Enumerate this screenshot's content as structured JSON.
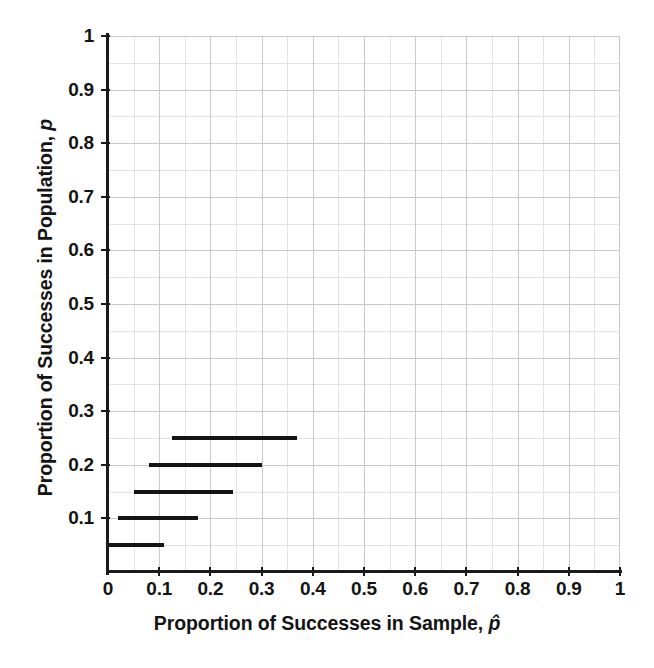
{
  "chart_data": {
    "type": "line",
    "title": "",
    "xlabel": "Proportion of Successes in Sample, p̂",
    "ylabel": "Proportion of Successes in Population, p",
    "xlim": [
      0,
      1
    ],
    "ylim": [
      0,
      1
    ],
    "grid": true,
    "grid_major_step": 0.1,
    "grid_minor_step": 0.05,
    "legend": "none",
    "x_ticks": [
      "0",
      "0.1",
      "0.2",
      "0.3",
      "0.4",
      "0.5",
      "0.6",
      "0.7",
      "0.8",
      "0.9",
      "1"
    ],
    "x_tick_values": [
      0,
      0.1,
      0.2,
      0.3,
      0.4,
      0.5,
      0.6,
      0.7,
      0.8,
      0.9,
      1
    ],
    "y_ticks": [
      "0.1",
      "0.2",
      "0.3",
      "0.4",
      "0.5",
      "0.6",
      "0.7",
      "0.8",
      "0.9",
      "1"
    ],
    "y_tick_values": [
      0.1,
      0.2,
      0.3,
      0.4,
      0.5,
      0.6,
      0.7,
      0.8,
      0.9,
      1
    ],
    "series": [
      {
        "name": "confidence-interval-segments",
        "orientation": "horizontal",
        "color": "#141414",
        "points": [
          {
            "p": 0.05,
            "x_start": 0.0,
            "x_end": 0.11
          },
          {
            "p": 0.1,
            "x_start": 0.02,
            "x_end": 0.175
          },
          {
            "p": 0.15,
            "x_start": 0.05,
            "x_end": 0.245
          },
          {
            "p": 0.2,
            "x_start": 0.08,
            "x_end": 0.3
          },
          {
            "p": 0.25,
            "x_start": 0.125,
            "x_end": 0.37
          }
        ]
      }
    ]
  },
  "axis": {
    "x_title_prefix": "Proportion of Successes in Sample, ",
    "x_title_symbol": "p̂",
    "y_title_prefix": "Proportion of Successes in Population, ",
    "y_title_symbol": "p"
  },
  "colors": {
    "grid_major": "#c9c9c9",
    "grid_minor": "#e2e2e2",
    "axis": "#1a1a1a",
    "data": "#141414",
    "background": "#ffffff"
  }
}
